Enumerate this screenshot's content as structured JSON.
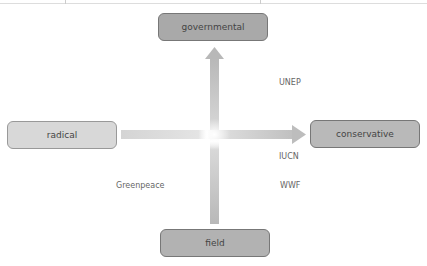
{
  "diagram": {
    "nodes": {
      "top": "governmental",
      "left": "radical",
      "right": "conservative",
      "bottom": "field"
    },
    "labels": {
      "unep": "UNEP",
      "iucn": "IUCN",
      "wwf": "WWF",
      "greenpeace": "Greenpeace"
    },
    "colors": {
      "governmental": "#a9a9a9",
      "radical": "#d8d8d8",
      "conservative": "#b9b9b9",
      "field": "#b2b2b2",
      "arrow": "#bdbdbd"
    }
  }
}
